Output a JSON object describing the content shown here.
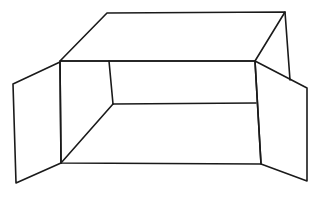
{
  "figure": {
    "subject": "open-box-line-drawing",
    "stroke_color": "#1a1a1a",
    "background": "#ffffff",
    "stroke_width": 1.6,
    "parts": {
      "top_face": [
        [
          107,
          13
        ],
        [
          285,
          12
        ],
        [
          255,
          61
        ],
        [
          60,
          61
        ]
      ],
      "back_right_edge": [
        [
          285,
          12
        ],
        [
          290,
          80
        ]
      ],
      "front_opening": [
        [
          60,
          61
        ],
        [
          255,
          61
        ],
        [
          261,
          164
        ],
        [
          61,
          163
        ]
      ],
      "inner_back_wall_left_edge": [
        [
          109,
          61
        ],
        [
          113,
          104
        ]
      ],
      "inner_back_wall_bottom_edge": [
        [
          113,
          104
        ],
        [
          256,
          103
        ]
      ],
      "floor_left_diagonal": [
        [
          113,
          104
        ],
        [
          61,
          163
        ]
      ],
      "left_flap": [
        [
          60,
          62
        ],
        [
          13,
          84
        ],
        [
          16,
          183
        ],
        [
          61,
          163
        ]
      ],
      "right_flap": [
        [
          255,
          61
        ],
        [
          307,
          88
        ],
        [
          307,
          181
        ],
        [
          261,
          164
        ]
      ]
    }
  }
}
